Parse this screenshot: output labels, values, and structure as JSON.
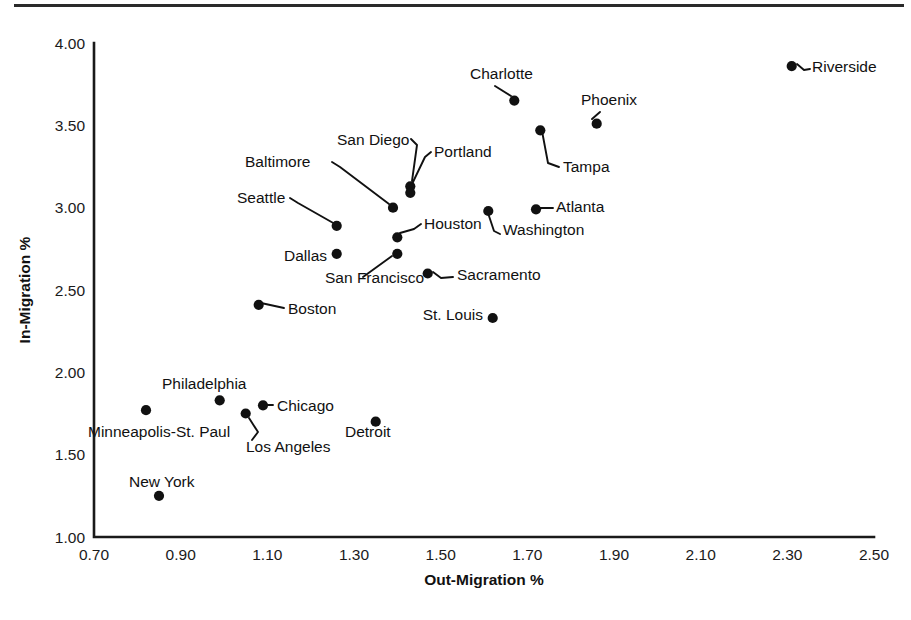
{
  "figure": {
    "has_top_rule": true,
    "background_color": "#ffffff",
    "ink_color": "#111111"
  },
  "chart_data": {
    "type": "scatter",
    "title": "",
    "subtitle": "",
    "xlabel": "Out-Migration %",
    "ylabel": "In-Migration %",
    "xlim": [
      0.7,
      2.5
    ],
    "ylim": [
      1.0,
      4.0
    ],
    "xticks": [
      "0.70",
      "0.90",
      "1.10",
      "1.30",
      "1.50",
      "1.70",
      "1.90",
      "2.10",
      "2.30",
      "2.50"
    ],
    "yticks": [
      "1.00",
      "1.50",
      "2.00",
      "2.50",
      "3.00",
      "3.50",
      "4.00"
    ],
    "xtick_values": [
      0.7,
      0.9,
      1.1,
      1.3,
      1.5,
      1.7,
      1.9,
      2.1,
      2.3,
      2.5
    ],
    "ytick_values": [
      1.0,
      1.5,
      2.0,
      2.5,
      3.0,
      3.5,
      4.0
    ],
    "grid": false,
    "legend": false,
    "legend_position": "none",
    "marker": "filled-circle",
    "marker_color": "#111111",
    "point_label_style": "leader-line",
    "points": [
      {
        "label": "Riverside",
        "x": 2.31,
        "y": 3.86
      },
      {
        "label": "Charlotte",
        "x": 1.67,
        "y": 3.65
      },
      {
        "label": "Phoenix",
        "x": 1.86,
        "y": 3.51
      },
      {
        "label": "Tampa",
        "x": 1.73,
        "y": 3.47
      },
      {
        "label": "San Diego",
        "x": 1.43,
        "y": 3.13
      },
      {
        "label": "Portland",
        "x": 1.43,
        "y": 3.09
      },
      {
        "label": "Baltimore",
        "x": 1.39,
        "y": 3.0
      },
      {
        "label": "Washington",
        "x": 1.61,
        "y": 2.98
      },
      {
        "label": "Atlanta",
        "x": 1.72,
        "y": 2.99
      },
      {
        "label": "Seattle",
        "x": 1.26,
        "y": 2.89
      },
      {
        "label": "Houston",
        "x": 1.4,
        "y": 2.82
      },
      {
        "label": "Dallas",
        "x": 1.26,
        "y": 2.72
      },
      {
        "label": "San Francisco",
        "x": 1.4,
        "y": 2.72
      },
      {
        "label": "Sacramento",
        "x": 1.47,
        "y": 2.6
      },
      {
        "label": "Boston",
        "x": 1.08,
        "y": 2.41
      },
      {
        "label": "St. Louis",
        "x": 1.62,
        "y": 2.33
      },
      {
        "label": "Philadelphia",
        "x": 0.99,
        "y": 1.83
      },
      {
        "label": "Chicago",
        "x": 1.09,
        "y": 1.8
      },
      {
        "label": "Minneapolis-St. Paul",
        "x": 0.82,
        "y": 1.77
      },
      {
        "label": "Los Angeles",
        "x": 1.05,
        "y": 1.75
      },
      {
        "label": "Detroit",
        "x": 1.35,
        "y": 1.7
      },
      {
        "label": "New York",
        "x": 0.85,
        "y": 1.25
      }
    ]
  },
  "labels": {
    "riverside": {
      "text": "Riverside",
      "tx": 812,
      "ty": 72,
      "anchor": "start",
      "leader": [
        [
          797,
          64
        ],
        [
          804,
          70
        ],
        [
          810,
          69
        ]
      ]
    },
    "charlotte": {
      "text": "Charlotte",
      "tx": 470,
      "ty": 79,
      "anchor": "start",
      "leader": [
        [
          495,
          86
        ],
        [
          511,
          96
        ]
      ]
    },
    "phoenix": {
      "text": "Phoenix",
      "tx": 581,
      "ty": 105,
      "anchor": "start",
      "leader": [
        [
          600,
          112
        ],
        [
          592,
          119
        ]
      ]
    },
    "tampa": {
      "text": "Tampa",
      "tx": 563,
      "ty": 172,
      "anchor": "start",
      "leader": [
        [
          542,
          131
        ],
        [
          548,
          163
        ],
        [
          559,
          167
        ]
      ]
    },
    "san_diego": {
      "text": "San Diego",
      "tx": 337,
      "ty": 145,
      "anchor": "start",
      "leader": [
        [
          411,
          139
        ],
        [
          417,
          145
        ],
        [
          412,
          181
        ]
      ]
    },
    "portland": {
      "text": "Portland",
      "tx": 434,
      "ty": 157,
      "anchor": "start",
      "leader": [
        [
          431,
          152
        ],
        [
          425,
          157
        ],
        [
          413,
          182
        ]
      ]
    },
    "baltimore": {
      "text": "Baltimore",
      "tx": 245,
      "ty": 167,
      "anchor": "start",
      "leader": [
        [
          332,
          162
        ],
        [
          340,
          167
        ],
        [
          389,
          204
        ]
      ]
    },
    "seattle": {
      "text": "Seattle",
      "tx": 237,
      "ty": 203,
      "anchor": "start",
      "leader": [
        [
          290,
          198
        ],
        [
          298,
          203
        ],
        [
          335,
          224
        ]
      ]
    },
    "houston": {
      "text": "Houston",
      "tx": 424,
      "ty": 229,
      "anchor": "start",
      "leader": [
        [
          421,
          224
        ],
        [
          414,
          229
        ],
        [
          400,
          233
        ]
      ]
    },
    "washington": {
      "text": "Washington",
      "tx": 503,
      "ty": 235,
      "anchor": "start",
      "leader": [
        [
          488,
          213
        ],
        [
          494,
          231
        ],
        [
          500,
          234
        ]
      ]
    },
    "atlanta": {
      "text": "Atlanta",
      "tx": 556,
      "ty": 212,
      "anchor": "start",
      "leader": [
        [
          538,
          208
        ],
        [
          553,
          208
        ]
      ]
    },
    "dallas": {
      "text": "Dallas",
      "tx": 284,
      "ty": 261,
      "anchor": "start",
      "leader": null
    },
    "san_francisco": {
      "text": "San Francisco",
      "tx": 325,
      "ty": 283,
      "anchor": "start",
      "leader": [
        [
          363,
          277
        ],
        [
          392,
          256
        ]
      ]
    },
    "sacramento": {
      "text": "Sacramento",
      "tx": 457,
      "ty": 280,
      "anchor": "start",
      "leader": [
        [
          433,
          272
        ],
        [
          441,
          278
        ],
        [
          453,
          277
        ]
      ]
    },
    "boston": {
      "text": "Boston",
      "tx": 288,
      "ty": 314,
      "anchor": "start",
      "leader": [
        [
          261,
          303
        ],
        [
          284,
          308
        ]
      ]
    },
    "st_louis": {
      "text": "St. Louis",
      "tx": 483,
      "ty": 320,
      "anchor": "end",
      "leader": null
    },
    "philadelphia": {
      "text": "Philadelphia",
      "tx": 162,
      "ty": 389,
      "anchor": "start",
      "leader": null
    },
    "chicago": {
      "text": "Chicago",
      "tx": 277,
      "ty": 411,
      "anchor": "start",
      "leader": [
        [
          260,
          405
        ],
        [
          273,
          405
        ]
      ]
    },
    "minneapolis_st_paul": {
      "text": "Minneapolis-St. Paul",
      "tx": 88,
      "ty": 437,
      "anchor": "start",
      "leader": null
    },
    "los_angeles": {
      "text": "Los Angeles",
      "tx": 246,
      "ty": 452,
      "anchor": "start",
      "leader": [
        [
          249,
          418
        ],
        [
          258,
          432
        ],
        [
          252,
          440
        ]
      ]
    },
    "detroit": {
      "text": "Detroit",
      "tx": 345,
      "ty": 437,
      "anchor": "start",
      "leader": null
    },
    "new_york": {
      "text": "New York",
      "tx": 129,
      "ty": 487,
      "anchor": "start",
      "leader": null
    }
  }
}
